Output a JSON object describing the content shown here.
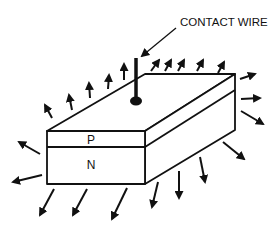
{
  "diagram": {
    "labels": {
      "contact_wire": "CONTACT WIRE",
      "p_layer": "P",
      "n_layer": "N"
    },
    "colors": {
      "stroke": "#111111",
      "background": "#ffffff"
    },
    "box": {
      "front_face": [
        [
          47,
          131
        ],
        [
          145,
          131
        ],
        [
          145,
          184
        ],
        [
          47,
          184
        ]
      ],
      "pn_divider_front": [
        [
          47,
          147
        ],
        [
          145,
          147
        ]
      ],
      "top_face": [
        [
          47,
          131
        ],
        [
          145,
          74
        ],
        [
          235,
          74
        ],
        [
          145,
          131
        ]
      ],
      "right_face": [
        [
          145,
          131
        ],
        [
          235,
          74
        ],
        [
          235,
          130
        ],
        [
          145,
          184
        ]
      ],
      "pn_divider_side": [
        [
          145,
          147
        ],
        [
          235,
          90
        ]
      ]
    },
    "wire": {
      "x": 136,
      "y_top": 58,
      "y_bottom": 100,
      "blob": [
        136,
        101
      ]
    },
    "leader": {
      "from": [
        176,
        28
      ],
      "to": [
        141,
        57
      ]
    },
    "arrows": [
      {
        "group": "top-left-edge",
        "from": [
          52,
          118
        ],
        "to": [
          45,
          105
        ]
      },
      {
        "group": "top-left-edge",
        "from": [
          72,
          110
        ],
        "to": [
          69,
          95
        ]
      },
      {
        "group": "top-left-edge",
        "from": [
          90,
          98
        ],
        "to": [
          89,
          83
        ]
      },
      {
        "group": "top-left-edge",
        "from": [
          108,
          89
        ],
        "to": [
          109,
          75
        ]
      },
      {
        "group": "top-left-edge",
        "from": [
          124,
          80
        ],
        "to": [
          124,
          64
        ]
      },
      {
        "group": "top-back-edge",
        "from": [
          151,
          71
        ],
        "to": [
          159,
          60
        ]
      },
      {
        "group": "top-back-edge",
        "from": [
          165,
          71
        ],
        "to": [
          171,
          60
        ]
      },
      {
        "group": "top-back-edge",
        "from": [
          178,
          71
        ],
        "to": [
          184,
          60
        ]
      },
      {
        "group": "top-back-edge",
        "from": [
          197,
          71
        ],
        "to": [
          203,
          60
        ]
      },
      {
        "group": "top-back-edge",
        "from": [
          218,
          73
        ],
        "to": [
          224,
          62
        ]
      },
      {
        "group": "right",
        "from": [
          240,
          79
        ],
        "to": [
          255,
          74
        ]
      },
      {
        "group": "right",
        "from": [
          241,
          99
        ],
        "to": [
          260,
          98
        ]
      },
      {
        "group": "right",
        "from": [
          241,
          111
        ],
        "to": [
          263,
          124
        ]
      },
      {
        "group": "left",
        "from": [
          40,
          154
        ],
        "to": [
          19,
          142
        ]
      },
      {
        "group": "left",
        "from": [
          42,
          175
        ],
        "to": [
          13,
          182
        ]
      },
      {
        "group": "bottom",
        "from": [
          54,
          189
        ],
        "to": [
          40,
          215
        ]
      },
      {
        "group": "bottom",
        "from": [
          87,
          189
        ],
        "to": [
          73,
          215
        ]
      },
      {
        "group": "bottom",
        "from": [
          127,
          188
        ],
        "to": [
          112,
          219
        ]
      },
      {
        "group": "bottom",
        "from": [
          158,
          182
        ],
        "to": [
          152,
          207
        ]
      },
      {
        "group": "bottom",
        "from": [
          179,
          171
        ],
        "to": [
          179,
          198
        ]
      },
      {
        "group": "bottom",
        "from": [
          200,
          157
        ],
        "to": [
          205,
          182
        ]
      },
      {
        "group": "bottom",
        "from": [
          223,
          142
        ],
        "to": [
          244,
          159
        ]
      }
    ]
  }
}
